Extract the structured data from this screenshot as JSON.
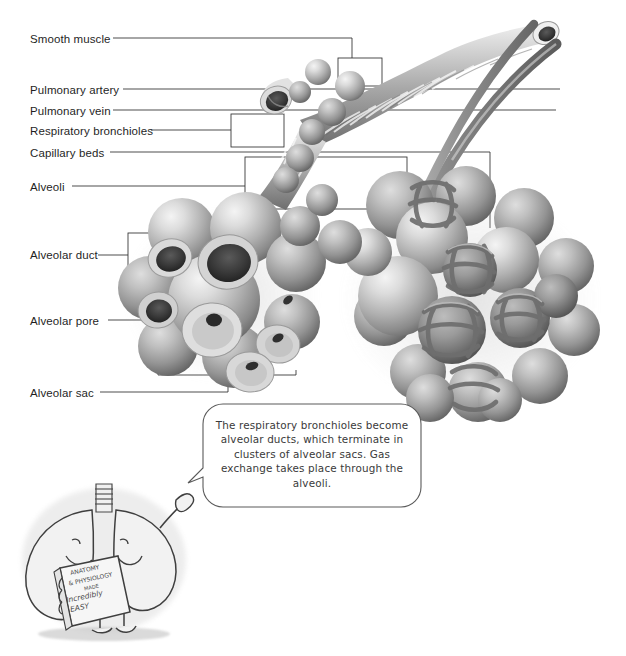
{
  "figure": {
    "kind": "anatomical-illustration",
    "palette": {
      "ink": "#1f1f1f",
      "leader_line": "#2b2b2b",
      "tissue_light": "#e9e9e9",
      "tissue_mid": "#b9b9b9",
      "tissue_dark": "#6f6f6f",
      "tissue_shadow": "#3d3d3d",
      "capillary": "#777777",
      "background": "#ffffff",
      "bubble_stroke": "#555555",
      "bubble_text": "#3a3a3a"
    }
  },
  "labels": [
    {
      "id": "smooth-muscle",
      "text": "Smooth muscle",
      "x": 30,
      "y": 33
    },
    {
      "id": "pulmonary-artery",
      "text": "Pulmonary artery",
      "x": 30,
      "y": 84
    },
    {
      "id": "pulmonary-vein",
      "text": "Pulmonary vein",
      "x": 30,
      "y": 105
    },
    {
      "id": "respiratory-bronchioles",
      "text": "Respiratory bronchioles",
      "x": 30,
      "y": 125
    },
    {
      "id": "capillary-beds",
      "text": "Capillary beds",
      "x": 30,
      "y": 147
    },
    {
      "id": "alveoli",
      "text": "Alveoli",
      "x": 30,
      "y": 181
    },
    {
      "id": "alveolar-duct",
      "text": "Alveolar duct",
      "x": 30,
      "y": 249
    },
    {
      "id": "alveolar-pore",
      "text": "Alveolar pore",
      "x": 30,
      "y": 315
    },
    {
      "id": "alveolar-sac",
      "text": "Alveolar sac",
      "x": 30,
      "y": 390
    }
  ],
  "callout": {
    "text": "The respiratory bronchioles become alveolar ducts, which terminate in clusters of alveolar sacs. Gas exchange takes place through the alveoli."
  },
  "mascot": {
    "name": "lungs-character",
    "book_title_lines": [
      "ANATOMY",
      "& PHYSIOLOGY",
      "MADE",
      "Incredibly",
      "EASY"
    ]
  }
}
